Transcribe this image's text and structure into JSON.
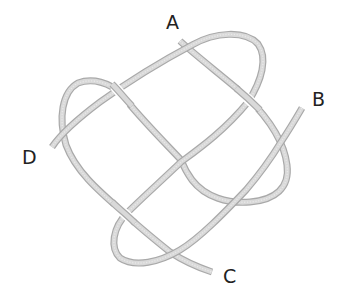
{
  "diagram": {
    "type": "knot",
    "colors": {
      "rope_edge": "#a9a9a9",
      "rope_fill": "#d9d9d9",
      "label": "#222222",
      "background": "#ffffff"
    },
    "labels": [
      {
        "id": "A",
        "text": "A"
      },
      {
        "id": "B",
        "text": "B"
      },
      {
        "id": "C",
        "text": "C"
      },
      {
        "id": "D",
        "text": "D"
      }
    ],
    "strands": [
      {
        "name": "strand-A-C",
        "from": "A",
        "to": "C"
      },
      {
        "name": "strand-B-D",
        "from": "B",
        "to": "D"
      }
    ]
  }
}
